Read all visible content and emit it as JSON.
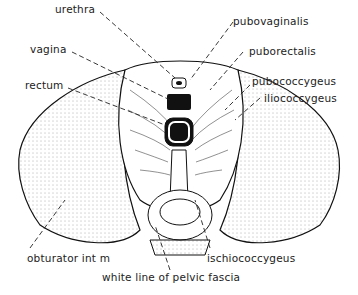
{
  "diagram": {
    "labels": {
      "urethra": "urethra",
      "vagina": "vagina",
      "rectum": "rectum",
      "pubovaginalis": "pubovaginalis",
      "puborectalis": "puborectalis",
      "pubococcygeus": "pubococcygeus",
      "iliococcygeus": "iliococcygeus",
      "obturator": "obturator int m",
      "ischiococcygeus": "ischiococcygeus",
      "white_line": "white line of pelvic fascia"
    }
  }
}
